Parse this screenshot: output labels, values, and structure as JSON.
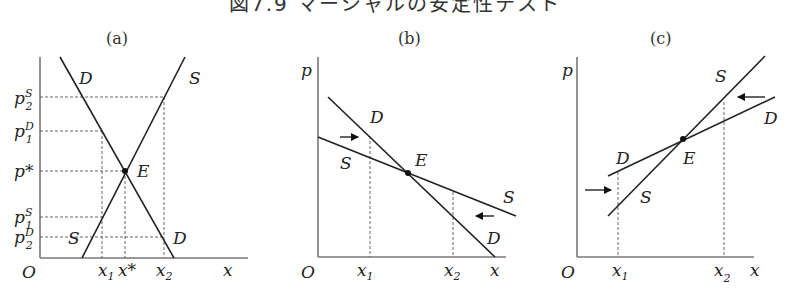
{
  "figure": {
    "title": "図7.9 マーシャルの安定性テスト",
    "panels": [
      {
        "id": "a",
        "label": "(a)",
        "axes": {
          "origin": "O",
          "x": "x",
          "y": ""
        },
        "curves": {
          "demand": "D",
          "supply": "S"
        },
        "equilibrium": "E",
        "price_ticks": [
          "p",
          "p",
          "p*",
          "p",
          "p"
        ],
        "price_tick_labels": [
          {
            "base": "p",
            "sup": "S",
            "sub": "2"
          },
          {
            "base": "p",
            "sup": "D",
            "sub": "1"
          },
          {
            "base": "p*",
            "sup": "",
            "sub": ""
          },
          {
            "base": "p",
            "sup": "S",
            "sub": "1"
          },
          {
            "base": "p",
            "sup": "D",
            "sub": "2"
          }
        ],
        "quantity_tick_labels": [
          {
            "base": "x",
            "sub": "1"
          },
          {
            "base": "x*",
            "sub": ""
          },
          {
            "base": "x",
            "sub": "2"
          }
        ]
      },
      {
        "id": "b",
        "label": "(b)",
        "axes": {
          "origin": "O",
          "x": "x",
          "y": "p"
        },
        "curves": {
          "demand": "D",
          "supply": "S"
        },
        "equilibrium": "E",
        "quantity_tick_labels": [
          {
            "base": "x",
            "sub": "1"
          },
          {
            "base": "x",
            "sub": "2"
          }
        ],
        "arrows": [
          "right-arrow-at-x1",
          "left-arrow-at-x2"
        ]
      },
      {
        "id": "c",
        "label": "(c)",
        "axes": {
          "origin": "O",
          "x": "x",
          "y": "p"
        },
        "curves": {
          "demand": "D",
          "supply": "S"
        },
        "equilibrium": "E",
        "quantity_tick_labels": [
          {
            "base": "x",
            "sub": "1"
          },
          {
            "base": "x",
            "sub": "2"
          }
        ],
        "arrows": [
          "right-arrow-at-x1",
          "left-arrow-at-x2"
        ]
      }
    ]
  },
  "labels": {
    "a": {
      "panel": "(a)",
      "O": "O",
      "x": "x",
      "D_top": "D",
      "S_top": "S",
      "E": "E",
      "S_bottom": "S",
      "D_bottom": "D",
      "p2S_base": "p",
      "p2S_sup": "S",
      "p2S_sub": "2",
      "p1D_base": "p",
      "p1D_sup": "D",
      "p1D_sub": "1",
      "pstar": "p*",
      "p1S_base": "p",
      "p1S_sup": "S",
      "p1S_sub": "1",
      "p2D_base": "p",
      "p2D_sup": "D",
      "p2D_sub": "2",
      "x1_base": "x",
      "x1_sub": "1",
      "xstar": "x*",
      "x2_base": "x",
      "x2_sub": "2"
    },
    "b": {
      "panel": "(b)",
      "O": "O",
      "x": "x",
      "p": "p",
      "D_top": "D",
      "S_left": "S",
      "E": "E",
      "S_right": "S",
      "D_bottom": "D",
      "x1_base": "x",
      "x1_sub": "1",
      "x2_base": "x",
      "x2_sub": "2"
    },
    "c": {
      "panel": "(c)",
      "O": "O",
      "x": "x",
      "p": "p",
      "S_top": "S",
      "D_right": "D",
      "D_left": "D",
      "E": "E",
      "S_bottom": "S",
      "x1_base": "x",
      "x1_sub": "1",
      "x2_base": "x",
      "x2_sub": "2"
    }
  }
}
